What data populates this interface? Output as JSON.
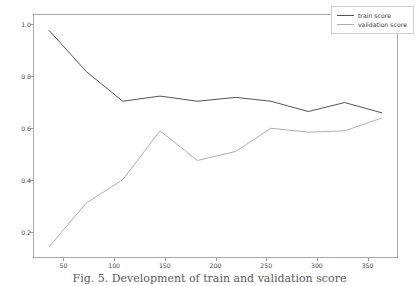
{
  "figure": {
    "caption": "Fig. 5. Development of train and validation score",
    "background_color": "#ffffff",
    "axes_color": "#a8a8a8"
  },
  "legend": {
    "position": "upper-right",
    "entries": [
      {
        "label": "train score",
        "color": "#555555"
      },
      {
        "label": "validation score",
        "color": "#b0b0b0"
      }
    ]
  },
  "chart_data": {
    "type": "line",
    "title": "",
    "xlabel": "",
    "ylabel": "",
    "xlim": [
      20,
      380
    ],
    "ylim": [
      0.1,
      1.04
    ],
    "grid": false,
    "legend_position": "upper right",
    "xticks": [
      50,
      100,
      150,
      200,
      250,
      300,
      350
    ],
    "xtick_labels": [
      "50",
      "100",
      "150",
      "200",
      "250",
      "300",
      "350"
    ],
    "yticks": [
      0.2,
      0.4,
      0.6,
      0.8,
      1.0
    ],
    "ytick_labels": [
      "0.2",
      "0.4",
      "0.6",
      "0.8",
      "1.0"
    ],
    "x": [
      35,
      72,
      108,
      145,
      182,
      220,
      255,
      292,
      328,
      365
    ],
    "series": [
      {
        "name": "train score",
        "color": "#555555",
        "values": [
          0.98,
          0.82,
          0.705,
          0.725,
          0.705,
          0.72,
          0.705,
          0.665,
          0.7,
          0.66
        ]
      },
      {
        "name": "validation score",
        "color": "#b0b0b0",
        "values": [
          0.14,
          0.31,
          0.4,
          0.59,
          0.475,
          0.51,
          0.6,
          0.585,
          0.59,
          0.64
        ]
      }
    ]
  }
}
